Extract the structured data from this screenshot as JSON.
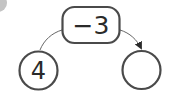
{
  "diagram": {
    "operation": {
      "label": "−3"
    },
    "start_node": {
      "value": "4"
    },
    "result_node": {
      "value": ""
    },
    "colors": {
      "stroke": "#4a4a4a",
      "text": "#2a2a2a",
      "corner_badge": "#b0b0b0"
    }
  }
}
